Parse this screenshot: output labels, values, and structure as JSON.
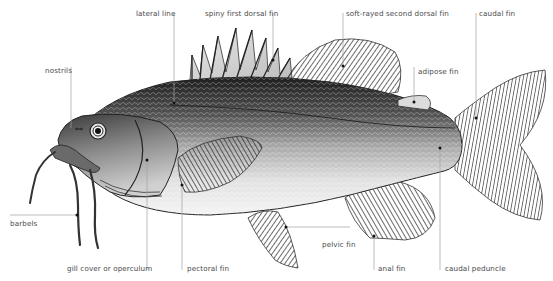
{
  "diagram": {
    "labels": [
      {
        "id": "lateral-line",
        "text": "lateral line",
        "x": 136,
        "y": 10
      },
      {
        "id": "spiny-first-dorsal-fin",
        "text": "spiny first dorsal fin",
        "x": 205,
        "y": 10
      },
      {
        "id": "soft-rayed-second-dorsal-fin",
        "text": "soft-rayed second dorsal fin",
        "x": 346,
        "y": 10
      },
      {
        "id": "caudal-fin",
        "text": "caudal fin",
        "x": 479,
        "y": 10
      },
      {
        "id": "nostrils",
        "text": "nostrils",
        "x": 45,
        "y": 67
      },
      {
        "id": "adipose-fin",
        "text": "adipose fin",
        "x": 418,
        "y": 67
      },
      {
        "id": "barbels",
        "text": "barbels",
        "x": 10,
        "y": 219
      },
      {
        "id": "pelvic-fin",
        "text": "pelvic fin",
        "x": 322,
        "y": 240
      },
      {
        "id": "gill-cover-or-operculum",
        "text": "gill cover or operculum",
        "x": 67,
        "y": 264
      },
      {
        "id": "pectoral-fin",
        "text": "pectoral fin",
        "x": 187,
        "y": 264
      },
      {
        "id": "anal-fin",
        "text": "anal fin",
        "x": 378,
        "y": 264
      },
      {
        "id": "caudal-peduncle",
        "text": "caudal peduncle",
        "x": 445,
        "y": 264
      }
    ]
  }
}
